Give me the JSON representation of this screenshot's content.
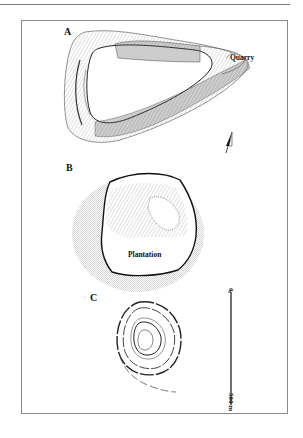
{
  "page": {
    "header_rule": true
  },
  "figure": {
    "panels": [
      {
        "id": "A",
        "label": "A",
        "annotations": [
          {
            "text": "Quarry"
          }
        ]
      },
      {
        "id": "B",
        "label": "B",
        "annotations": [
          {
            "text": "Plantation"
          }
        ]
      },
      {
        "id": "C",
        "label": "C",
        "annotations": []
      }
    ],
    "north_arrow": {
      "present": true,
      "panel": "A"
    },
    "scale_bar": {
      "start_label": "0",
      "end_label": "500 m",
      "orientation": "vertical"
    }
  }
}
